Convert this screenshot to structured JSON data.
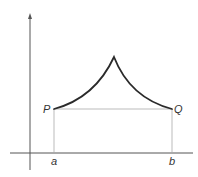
{
  "diagram": {
    "labels": {
      "P": "P",
      "Q": "Q",
      "a": "a",
      "b": "b"
    },
    "colors": {
      "curve": "#2a2a2a",
      "axes": "#555555",
      "guides": "#aaaaaa",
      "text": "#333333"
    }
  }
}
